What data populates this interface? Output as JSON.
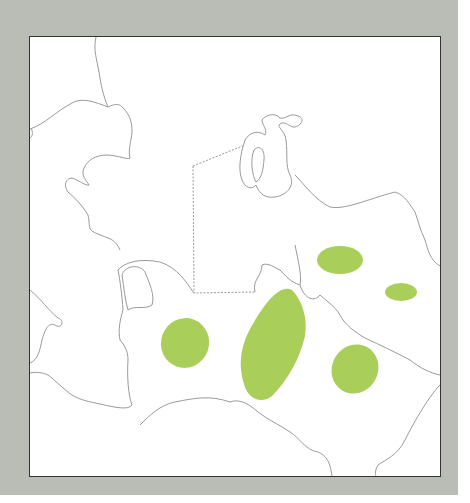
{
  "map": {
    "background_color": "#b9bdb6",
    "frame_color": "#ffffff",
    "border_line_color": "#9a9a9a",
    "region_fill_color": "#a9cf5a",
    "regions": [
      {
        "name": "west-region",
        "cx": 185,
        "cy": 343,
        "rx": 24,
        "ry": 25
      },
      {
        "name": "central-region",
        "cx": 274,
        "cy": 344,
        "rx": 28,
        "ry": 60
      },
      {
        "name": "north-region",
        "cx": 340,
        "cy": 260,
        "rx": 23,
        "ry": 14
      },
      {
        "name": "east-small-region",
        "cx": 401,
        "cy": 292,
        "rx": 16,
        "ry": 9
      },
      {
        "name": "southeast-region",
        "cx": 355,
        "cy": 369,
        "rx": 24,
        "ry": 25
      }
    ]
  }
}
